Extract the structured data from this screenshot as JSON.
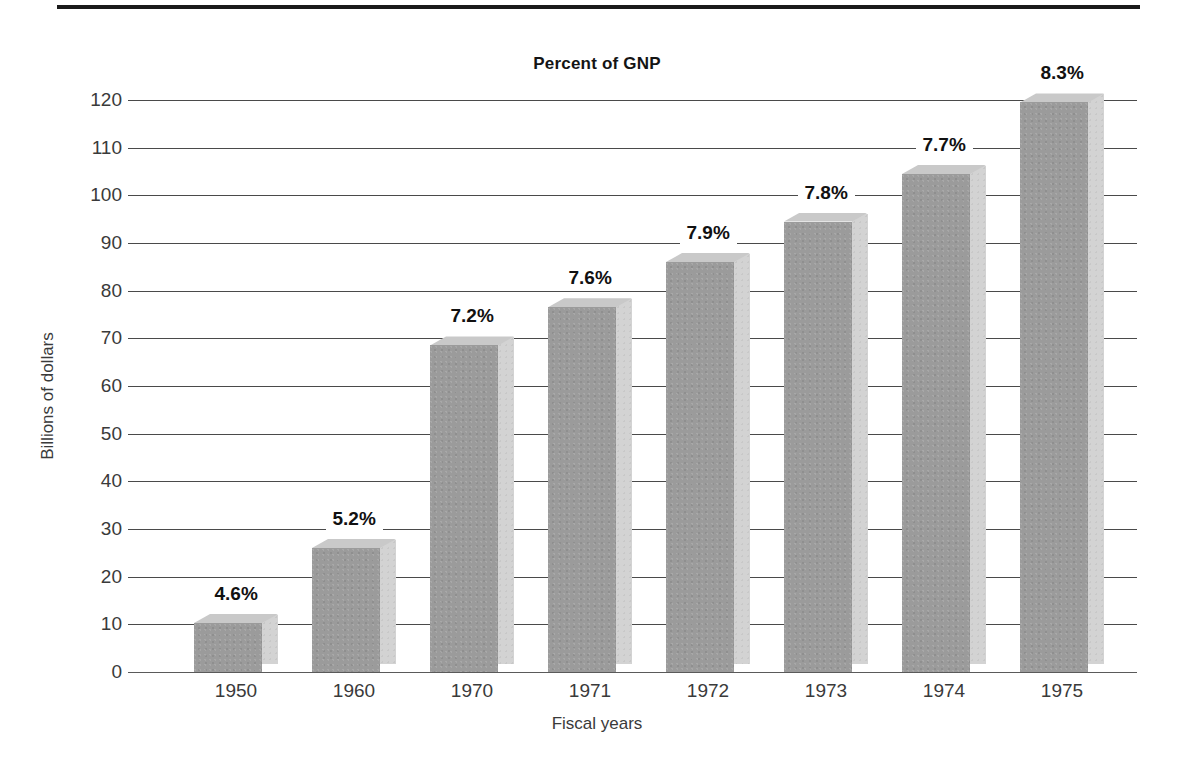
{
  "chart_data": {
    "type": "bar",
    "title": "Percent of GNP",
    "xlabel": "Fiscal years",
    "ylabel": "Billions of dollars",
    "categories": [
      "1950",
      "1960",
      "1970",
      "1971",
      "1972",
      "1973",
      "1974",
      "1975"
    ],
    "values": [
      10.3,
      26,
      68.5,
      76.5,
      86,
      94.5,
      104.5,
      119.5
    ],
    "point_labels": [
      "4.6%",
      "5.2%",
      "7.2%",
      "7.6%",
      "7.9%",
      "7.8%",
      "7.7%",
      "8.3%"
    ],
    "ylim": [
      0,
      120
    ],
    "ytick_labels": [
      "120",
      "110",
      "100",
      "90",
      "80",
      "70",
      "60",
      "50",
      "40",
      "30",
      "20",
      "10",
      "0"
    ],
    "ytick_values": [
      120,
      110,
      100,
      90,
      80,
      70,
      60,
      50,
      40,
      30,
      20,
      10,
      0
    ],
    "grid": true,
    "legend": "none",
    "series_name": "Percent of GNP",
    "bar_face_color": "#9b9b9b",
    "bar_side_color": "#d3d3d3",
    "bar_top_color": "#c9c9c9",
    "gridline_color": "#4a4a4a",
    "rule_color": "#1a1a1a"
  }
}
